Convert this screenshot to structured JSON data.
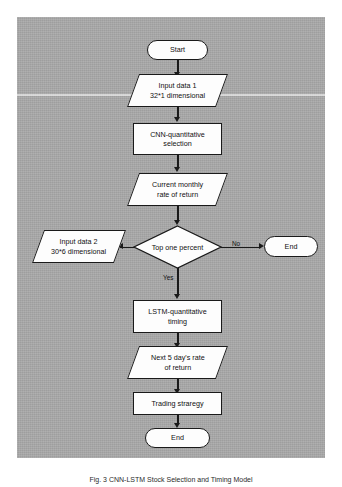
{
  "figure": {
    "panel_color": "#a9a9a9",
    "node_fill": "#fdfdfd",
    "stroke_color": "#1a1a1a",
    "caption": "Fig. 3  CNN-LSTM Stock Selection and Timing Model"
  },
  "nodes": {
    "start": {
      "label": "Start",
      "shape": "terminator"
    },
    "input_data_1": {
      "label": "Input data 1\n32*1 dimensional",
      "shape": "parallelogram"
    },
    "cnn_selection": {
      "label": "CNN-quantitative\nselection",
      "shape": "process"
    },
    "current_return": {
      "label": "Current monthly\nrate of return",
      "shape": "parallelogram"
    },
    "input_data_2": {
      "label": "Input data 2\n30*6 dimensional",
      "shape": "parallelogram"
    },
    "decision": {
      "label": "Top one percent",
      "shape": "decision"
    },
    "end_no": {
      "label": "End",
      "shape": "terminator"
    },
    "lstm_timing": {
      "label": "LSTM-quantitative\ntiming",
      "shape": "process"
    },
    "next5_return": {
      "label": "Next 5 day's rate\nof return",
      "shape": "parallelogram"
    },
    "trading_strategy": {
      "label": "Trading straregy",
      "shape": "process"
    },
    "end_final": {
      "label": "End",
      "shape": "terminator"
    }
  },
  "edge_labels": {
    "yes": "Yes",
    "no": "No"
  }
}
